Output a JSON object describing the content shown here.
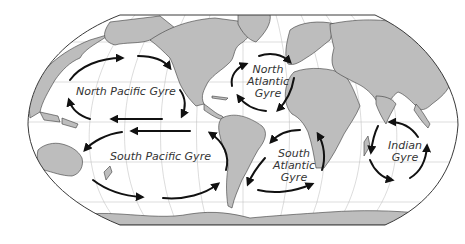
{
  "map": {
    "title": "Ocean Gyres",
    "projection": "Robinson world map",
    "colors": {
      "land": "#bdbdbd",
      "ocean": "#ffffff",
      "coastline": "#3a3a3a",
      "graticule": "#b9b9b9",
      "arrows": "#111111",
      "label_text": "#333333"
    },
    "labels": {
      "north_pacific": "North Pacific Gyre",
      "south_pacific": "South Pacific Gyre",
      "north_atlantic_line1": "North",
      "north_atlantic_line2": "Atlantic",
      "north_atlantic_line3": "Gyre",
      "south_atlantic_line1": "South",
      "south_atlantic_line2": "Atlantic",
      "south_atlantic_line3": "Gyre",
      "indian_line1": "Indian",
      "indian_line2": "Gyre"
    },
    "gyres": [
      {
        "name": "North Pacific Gyre",
        "rotation": "clockwise"
      },
      {
        "name": "South Pacific Gyre",
        "rotation": "counterclockwise"
      },
      {
        "name": "North Atlantic Gyre",
        "rotation": "clockwise"
      },
      {
        "name": "South Atlantic Gyre",
        "rotation": "counterclockwise"
      },
      {
        "name": "Indian Gyre",
        "rotation": "counterclockwise"
      }
    ]
  }
}
